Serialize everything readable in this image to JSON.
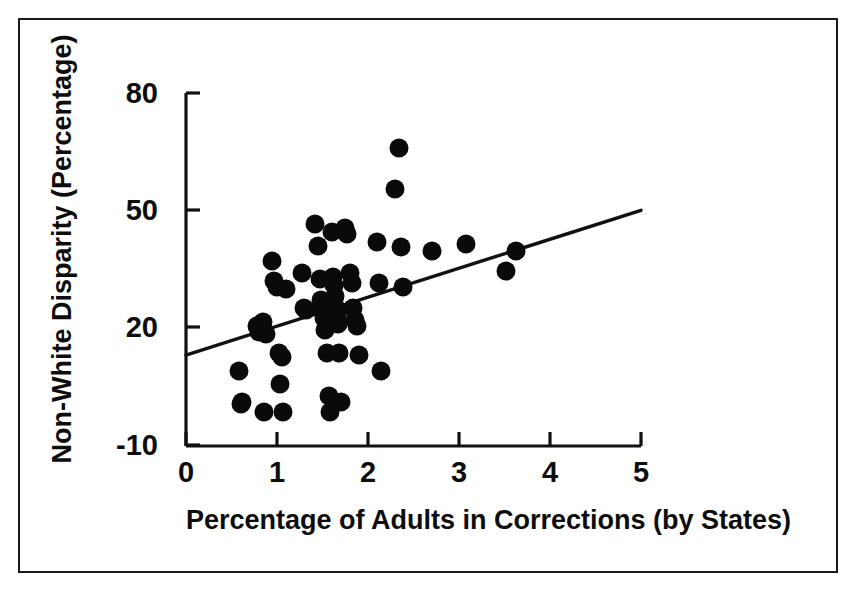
{
  "figure": {
    "background_color": "#ffffff",
    "frame_color": "#1a1a1a",
    "marker_color": "#0a0a0a",
    "line_color": "#111111"
  },
  "axes": {
    "y_title": "Non-White Disparity (Percentage)",
    "x_title": "Percentage of Adults in Corrections (by States)",
    "y_ticks": [
      "80",
      "50",
      "20",
      "-10"
    ],
    "x_ticks": [
      "0",
      "1",
      "2",
      "3",
      "4",
      "5"
    ]
  },
  "chart_data": {
    "type": "scatter",
    "title": "",
    "xlabel": "Percentage of Adults in Corrections (by States)",
    "ylabel": "Non-White Disparity (Percentage)",
    "xlim": [
      0,
      5
    ],
    "ylim": [
      -10,
      80
    ],
    "xticks": [
      0,
      1,
      2,
      3,
      4,
      5
    ],
    "yticks": [
      -10,
      20,
      50,
      80
    ],
    "grid": false,
    "legend": "none",
    "marker": "filled-circle",
    "marker_size_px": 19,
    "series": [
      {
        "name": "States",
        "points": [
          [
            0.58,
            9.0
          ],
          [
            0.6,
            0.5
          ],
          [
            0.62,
            1.0
          ],
          [
            0.78,
            20.5
          ],
          [
            0.8,
            19.0
          ],
          [
            0.85,
            21.5
          ],
          [
            0.86,
            -1.5
          ],
          [
            0.88,
            18.5
          ],
          [
            0.95,
            37.0
          ],
          [
            0.97,
            32.0
          ],
          [
            1.0,
            30.5
          ],
          [
            1.02,
            13.5
          ],
          [
            1.03,
            5.5
          ],
          [
            1.05,
            12.5
          ],
          [
            1.07,
            -1.5
          ],
          [
            1.1,
            30.0
          ],
          [
            1.28,
            34.0
          ],
          [
            1.3,
            25.0
          ],
          [
            1.32,
            24.5
          ],
          [
            1.42,
            46.5
          ],
          [
            1.45,
            41.0
          ],
          [
            1.47,
            32.5
          ],
          [
            1.48,
            27.0
          ],
          [
            1.5,
            24.0
          ],
          [
            1.52,
            22.5
          ],
          [
            1.53,
            19.5
          ],
          [
            1.55,
            13.5
          ],
          [
            1.57,
            2.5
          ],
          [
            1.58,
            -1.5
          ],
          [
            1.6,
            44.5
          ],
          [
            1.62,
            33.0
          ],
          [
            1.63,
            31.0
          ],
          [
            1.64,
            28.0
          ],
          [
            1.65,
            25.0
          ],
          [
            1.66,
            23.0
          ],
          [
            1.67,
            21.0
          ],
          [
            1.68,
            13.5
          ],
          [
            1.7,
            1.0
          ],
          [
            1.75,
            45.5
          ],
          [
            1.77,
            44.0
          ],
          [
            1.8,
            34.0
          ],
          [
            1.82,
            31.5
          ],
          [
            1.84,
            25.0
          ],
          [
            1.86,
            22.0
          ],
          [
            1.88,
            20.5
          ],
          [
            1.9,
            13.0
          ],
          [
            2.1,
            42.0
          ],
          [
            2.12,
            31.5
          ],
          [
            2.14,
            9.0
          ],
          [
            2.3,
            55.5
          ],
          [
            2.34,
            66.0
          ],
          [
            2.36,
            40.5
          ],
          [
            2.38,
            30.5
          ],
          [
            2.7,
            39.5
          ],
          [
            3.08,
            41.5
          ],
          [
            3.52,
            34.5
          ],
          [
            3.63,
            39.5
          ]
        ]
      }
    ],
    "trendline": {
      "name": "linear fit",
      "x0": 0.0,
      "y0": 13.0,
      "x1": 5.0,
      "y1": 50.0
    }
  }
}
